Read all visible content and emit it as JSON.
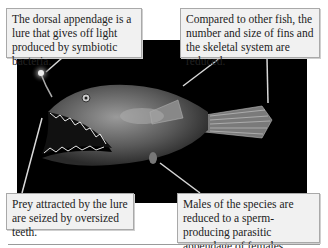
{
  "figure": {
    "callouts": [
      {
        "id": "lure",
        "text": "The dorsal appendage is a lure that gives off light produced by symbiotic bacteria."
      },
      {
        "id": "fins",
        "text": "Compared to other fish, the number and size of fins and the skeletal system are reduced."
      },
      {
        "id": "teeth",
        "text": "Prey attracted by the lure are seized by oversized teeth."
      },
      {
        "id": "males",
        "text": "Males of the species are reduced to a sperm-producing parasitic appendage of females."
      }
    ],
    "colors": {
      "background": "#000000",
      "callout_bg": "#f1f1f1",
      "callout_border": "#a9a9a9",
      "pointer": "#d8d8d8"
    }
  }
}
